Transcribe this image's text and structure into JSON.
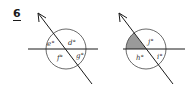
{
  "problem": {
    "number": "6"
  },
  "colors": {
    "line": "#1a1a1a",
    "circle": "#444444",
    "shaded": "#9a9a9a",
    "background": "#ffffff"
  },
  "diagrams": [
    {
      "id": "left",
      "angles": [
        {
          "label": "e°",
          "position": "upper-left",
          "shaded": false
        },
        {
          "label": "d°",
          "position": "upper-right",
          "shaded": false
        },
        {
          "label": "f°",
          "position": "lower-left",
          "shaded": false
        },
        {
          "label": "g°",
          "position": "lower-right",
          "shaded": false
        }
      ]
    },
    {
      "id": "right",
      "angles": [
        {
          "label": "",
          "position": "upper-left",
          "shaded": true
        },
        {
          "label": "j°",
          "position": "upper-right",
          "shaded": false
        },
        {
          "label": "h°",
          "position": "lower-left",
          "shaded": false
        },
        {
          "label": "i°",
          "position": "lower-right",
          "shaded": false
        }
      ]
    }
  ]
}
